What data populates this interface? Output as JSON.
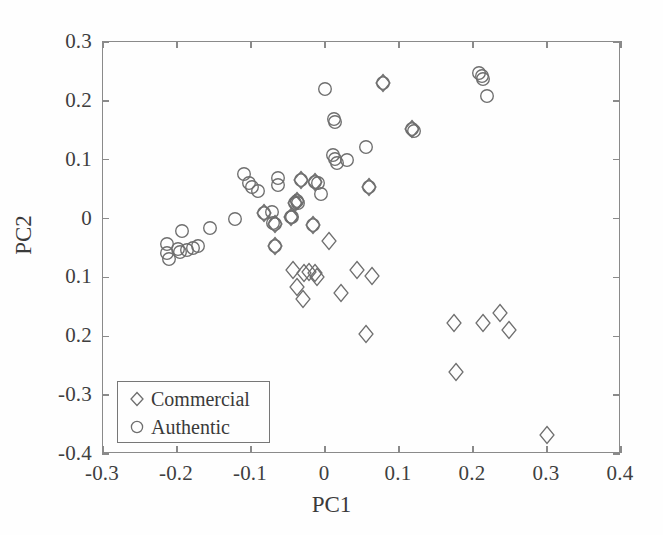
{
  "figure": {
    "background_color": "#fefefe",
    "frame_color": "#8a8a8a",
    "marker_color": "#6e6e6e"
  },
  "axis_titles": {
    "x": "PC1",
    "y": "PC2"
  },
  "legend": {
    "entries": [
      {
        "label": "Commercial",
        "marker": "diamond-marker"
      },
      {
        "label": "Authentic",
        "marker": "circle-marker"
      }
    ]
  },
  "chart_data": {
    "type": "scatter",
    "title": "",
    "xlabel": "PC1",
    "ylabel": "PC2",
    "xlim": [
      -0.3,
      0.4
    ],
    "ylim": [
      -0.4,
      0.3
    ],
    "xticks": [
      -0.3,
      -0.2,
      -0.1,
      0,
      0.1,
      0.2,
      0.3,
      0.4
    ],
    "xticklabels": [
      "-0.3",
      "-0.2",
      "-0.1",
      "0",
      "0.1",
      "0.2",
      "0.3",
      "0.4"
    ],
    "yticks": [
      0.3,
      0.2,
      0.1,
      0,
      -0.1,
      -0.2,
      -0.3,
      -0.4
    ],
    "yticklabels": [
      "0.3",
      "0.2",
      "0.1",
      "0",
      "0.1",
      "0.2",
      "-0.3",
      "-0.4"
    ],
    "grid": false,
    "legend_position": "lower left",
    "series": [
      {
        "name": "Authentic",
        "marker": "circle",
        "points": [
          [
            -0.213,
            -0.058
          ],
          [
            -0.211,
            -0.068
          ],
          [
            -0.213,
            -0.044
          ],
          [
            -0.199,
            -0.052
          ],
          [
            -0.196,
            -0.057
          ],
          [
            -0.193,
            -0.021
          ],
          [
            -0.186,
            -0.053
          ],
          [
            -0.178,
            -0.05
          ],
          [
            -0.172,
            -0.046
          ],
          [
            -0.155,
            -0.016
          ],
          [
            -0.122,
            -0.001
          ],
          [
            -0.109,
            0.076
          ],
          [
            -0.103,
            0.061
          ],
          [
            -0.098,
            0.053
          ],
          [
            -0.091,
            0.046
          ],
          [
            -0.083,
            0.009
          ],
          [
            -0.072,
            0.011
          ],
          [
            -0.07,
            -0.007
          ],
          [
            -0.067,
            -0.009
          ],
          [
            -0.064,
            0.069
          ],
          [
            -0.063,
            0.057
          ],
          [
            -0.068,
            -0.046
          ],
          [
            -0.046,
            0.003
          ],
          [
            -0.044,
            0.002
          ],
          [
            -0.04,
            0.027
          ],
          [
            -0.038,
            0.03
          ],
          [
            -0.036,
            0.026
          ],
          [
            -0.033,
            0.066
          ],
          [
            -0.016,
            -0.011
          ],
          [
            -0.013,
            0.062
          ],
          [
            -0.009,
            0.06
          ],
          [
            -0.005,
            0.041
          ],
          [
            0.0,
            0.22
          ],
          [
            0.012,
            0.17
          ],
          [
            0.013,
            0.164
          ],
          [
            0.011,
            0.108
          ],
          [
            0.013,
            0.101
          ],
          [
            0.016,
            0.095
          ],
          [
            0.03,
            0.099
          ],
          [
            0.055,
            0.122
          ],
          [
            0.06,
            0.054
          ],
          [
            0.079,
            0.23
          ],
          [
            0.118,
            0.152
          ],
          [
            0.12,
            0.149
          ],
          [
            0.208,
            0.247
          ],
          [
            0.212,
            0.243
          ],
          [
            0.214,
            0.237
          ],
          [
            0.219,
            0.209
          ]
        ]
      },
      {
        "name": "Commercial",
        "marker": "diamond",
        "points": [
          [
            -0.083,
            0.009
          ],
          [
            -0.068,
            -0.046
          ],
          [
            -0.046,
            0.003
          ],
          [
            -0.04,
            0.027
          ],
          [
            -0.038,
            0.03
          ],
          [
            -0.067,
            -0.009
          ],
          [
            -0.033,
            0.066
          ],
          [
            -0.016,
            -0.011
          ],
          [
            -0.013,
            0.062
          ],
          [
            0.06,
            0.054
          ],
          [
            0.079,
            0.23
          ],
          [
            0.118,
            0.152
          ],
          [
            -0.043,
            -0.088
          ],
          [
            -0.029,
            -0.092
          ],
          [
            -0.022,
            -0.091
          ],
          [
            -0.014,
            -0.092
          ],
          [
            -0.038,
            -0.117
          ],
          [
            -0.03,
            -0.137
          ],
          [
            -0.011,
            -0.1
          ],
          [
            0.006,
            -0.038
          ],
          [
            0.022,
            -0.127
          ],
          [
            0.043,
            -0.088
          ],
          [
            0.055,
            -0.196
          ],
          [
            0.063,
            -0.098
          ],
          [
            0.174,
            -0.177
          ],
          [
            0.177,
            -0.26
          ],
          [
            0.213,
            -0.178
          ],
          [
            0.237,
            -0.16
          ],
          [
            0.248,
            -0.19
          ],
          [
            0.3,
            -0.368
          ]
        ]
      }
    ]
  }
}
